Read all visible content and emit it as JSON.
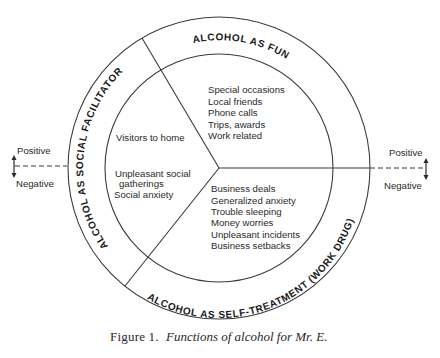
{
  "diagram": {
    "rings": {
      "fun": "ALCOHOL AS FUN",
      "social": "ALCOHOL AS SOCIAL FACILITATOR",
      "self_treatment": "ALCOHOL AS SELF-TREATMENT (WORK DRUG)"
    },
    "sectors": {
      "fun": {
        "items": [
          "Special occasions",
          "Local friends",
          "Phone calls",
          "Trips, awards",
          "Work related"
        ]
      },
      "social": {
        "items": [
          "Visitors to home",
          "Unpleasant social",
          "gatherings",
          "Social anxiety"
        ]
      },
      "self_treatment": {
        "items": [
          "Business deals",
          "Generalized anxiety",
          "Trouble sleeping",
          "Money worries",
          "Unpleasant incidents",
          "Business setbacks"
        ]
      }
    },
    "axis": {
      "left": {
        "positive": "Positive",
        "negative": "Negative"
      },
      "right": {
        "positive": "Positive",
        "negative": "Negative"
      }
    },
    "caption": {
      "label": "Figure 1.",
      "text": "Functions of alcohol for Mr. E."
    },
    "colors": {
      "ink": "#2a2a2a",
      "background": "#ffffff"
    }
  }
}
